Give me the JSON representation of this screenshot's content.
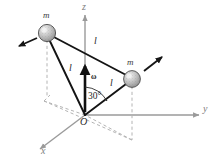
{
  "figure": {
    "kind": "mechanics-diagram",
    "background_color": "#ffffff",
    "line_color": "#1a1a1a",
    "axis_color": "#9a9a9a",
    "dashed_color": "#b0b0b0",
    "sphere_fill": "#c8c8c8",
    "sphere_stroke": "#4a4a4a"
  },
  "axes": {
    "z_label": "z",
    "y_label": "y",
    "x_label": "x",
    "origin_label": "O"
  },
  "masses": [
    {
      "label": "m",
      "name": "mass-left"
    },
    {
      "label": "m",
      "name": "mass-right"
    }
  ],
  "lengths": [
    {
      "label": "l",
      "name": "rod-length-top"
    },
    {
      "label": "l",
      "name": "rod-length-left"
    },
    {
      "label": "l",
      "name": "rod-length-right"
    }
  ],
  "vectors": {
    "omega_label": "ω",
    "omega_name": "angular-velocity-vector",
    "velocity_left_name": "velocity-arrow-left",
    "velocity_right_name": "velocity-arrow-right"
  },
  "angle": {
    "value": "30",
    "unit": "°",
    "label": "30°"
  }
}
